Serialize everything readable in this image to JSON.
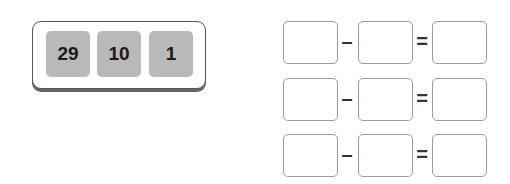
{
  "number_card": {
    "tiles": [
      "29",
      "10",
      "1"
    ]
  },
  "equations": {
    "operator_minus": "–",
    "operator_equals": "=",
    "rows": [
      {
        "a": "",
        "b": "",
        "result": ""
      },
      {
        "a": "",
        "b": "",
        "result": ""
      },
      {
        "a": "",
        "b": "",
        "result": ""
      }
    ]
  }
}
